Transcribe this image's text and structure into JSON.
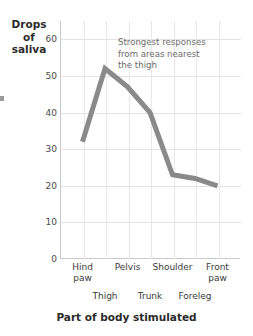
{
  "chart_data": {
    "type": "line",
    "title": "",
    "xlabel": "Part of body stimulated",
    "ylabel": "Drops of saliva",
    "ylabel_lines": [
      "Drops",
      "of",
      "saliva"
    ],
    "categories": [
      "Hind paw",
      "Thigh",
      "Pelvis",
      "Trunk",
      "Shoulder",
      "Foreleg",
      "Front paw"
    ],
    "values": [
      32,
      52,
      47,
      40,
      23,
      22,
      20
    ],
    "series": [
      {
        "name": "Drops of saliva",
        "values": [
          32,
          52,
          47,
          40,
          23,
          22,
          20
        ]
      }
    ],
    "ylim": [
      0,
      65
    ],
    "yticks": [
      0,
      10,
      20,
      30,
      40,
      50,
      60
    ],
    "ytick_labels": [
      "0",
      "10",
      "20",
      "30",
      "40",
      "50",
      "60"
    ],
    "xtick_labels_top_row": [
      "Hind paw",
      "Pelvis",
      "Shoulder",
      "Front paw"
    ],
    "xtick_labels_bottom_row": [
      "Thigh",
      "Trunk",
      "Foreleg"
    ],
    "xtick_top_multiline": [
      [
        "Hind",
        "paw"
      ],
      [
        "Pelvis"
      ],
      [
        "Shoulder"
      ],
      [
        "Front",
        "paw"
      ]
    ],
    "grid": true,
    "legend": "none",
    "annotations": [
      {
        "name": "strongest-response-note",
        "lines": [
          "Strongest responses",
          "from areas nearest",
          "the thigh"
        ],
        "text": "Strongest responses from areas nearest the thigh"
      }
    ],
    "colors": {
      "line": "#8a8a8a",
      "grid": "#e3e3e3",
      "axis": "#c9c9c9",
      "text": "#3a3a3a",
      "annotation_text": "#6b6b6b",
      "background": "#ffffff"
    },
    "line_width_px": 5
  }
}
